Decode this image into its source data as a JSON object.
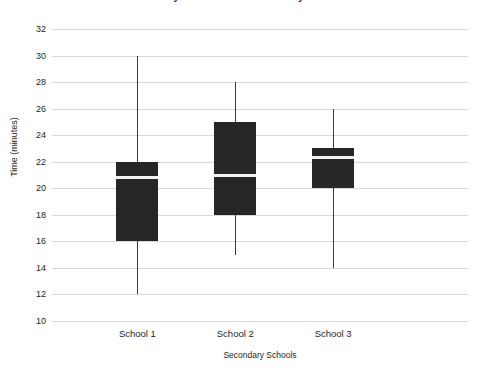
{
  "chart_data": {
    "type": "box",
    "title": "Journey times to three Secondary Schools",
    "xlabel": "Secondary Schools",
    "ylabel": "Time (minutes)",
    "categories": [
      "School 1",
      "School 2",
      "School 3"
    ],
    "ylim": [
      10,
      32
    ],
    "ytick_step": 2,
    "yticks": [
      32,
      30,
      28,
      26,
      24,
      22,
      20,
      18,
      16,
      14,
      12,
      10
    ],
    "grid": true,
    "legend": "none",
    "box_color": "#262626",
    "median_color": "#f2f2f2",
    "whisker_color": "#3a3a3a",
    "gridline_color": "#d8d8d8",
    "boxes": [
      {
        "name": "School 1",
        "min": 12,
        "q1": 16,
        "median": 20.8,
        "q3": 22,
        "max": 30
      },
      {
        "name": "School 2",
        "min": 15,
        "q1": 18,
        "median": 21,
        "q3": 25,
        "max": 28
      },
      {
        "name": "School 3",
        "min": 14,
        "q1": 20,
        "median": 22.3,
        "q3": 23,
        "max": 26
      }
    ]
  }
}
